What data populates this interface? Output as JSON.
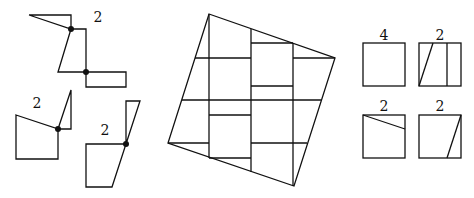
{
  "diagram": {
    "colors": {
      "stroke": "#111111",
      "background": "#ffffff"
    },
    "left_pieces": {
      "labels": [
        "2",
        "2",
        "2"
      ],
      "hinge_count": 4
    },
    "center_figure": {
      "description": "Tilted square dissected into grid of rectangular pieces"
    },
    "right_squares": {
      "labels": [
        "4",
        "2",
        "2",
        "2"
      ]
    }
  }
}
